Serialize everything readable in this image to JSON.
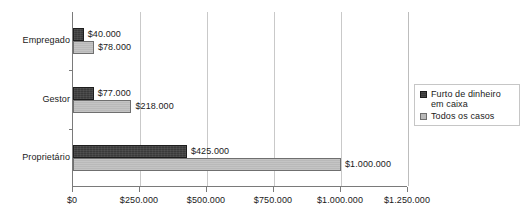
{
  "chart_data": {
    "type": "bar",
    "orientation": "horizontal",
    "title": "",
    "xlabel": "",
    "ylabel": "",
    "categories": [
      "Empregado",
      "Gestor",
      "Proprietário"
    ],
    "series": [
      {
        "name": "Furto de dinheiro em caixa",
        "color": "#3a3a3a",
        "values": [
          40000,
          77000,
          425000
        ],
        "labels": [
          "$40.000",
          "$77.000",
          "$425.000"
        ]
      },
      {
        "name": "Todos os casos",
        "color": "#b9b9b9",
        "values": [
          78000,
          218000,
          1000000
        ],
        "labels": [
          "$78.000",
          "$218.000",
          "$1.000.000"
        ]
      }
    ],
    "xlim": [
      0,
      1250000
    ],
    "xticks": [
      0,
      250000,
      500000,
      750000,
      1000000,
      1250000
    ],
    "xtick_labels": [
      "$0",
      "$250.000",
      "$500.000",
      "$750.000",
      "$1.000.000",
      "$1.250.000"
    ],
    "grid": "vertical",
    "legend_position": "right"
  },
  "legend": {
    "items": [
      {
        "label_line1": "Furto de dinheiro",
        "label_line2": "em caixa",
        "swatch": "dark"
      },
      {
        "label_line1": "Todos os casos",
        "label_line2": "",
        "swatch": "light"
      }
    ]
  }
}
